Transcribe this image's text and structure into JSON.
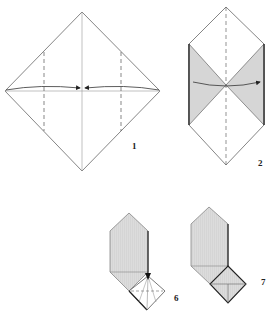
{
  "steps": [
    {
      "number": "1",
      "description": "Square paper in diamond orientation; fold left and right corners to center along dashed valley lines"
    },
    {
      "number": "2",
      "description": "Side flaps folded in, shaded triangles; fold in half along dashed center line"
    },
    {
      "number": "6",
      "description": "Hexagonal shaded body with square flap at lower right being folded"
    },
    {
      "number": "7",
      "description": "Hexagonal shaded body with square flap folded, X creases visible"
    }
  ],
  "colors": {
    "line": "#555555",
    "shade": "#d6d6d6",
    "arrow": "#333333"
  }
}
